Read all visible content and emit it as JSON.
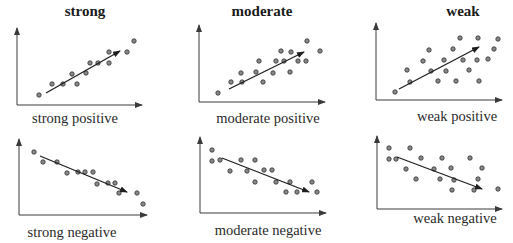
{
  "columns": [
    {
      "title": "strong",
      "x": 85
    },
    {
      "title": "moderate",
      "x": 262
    },
    {
      "title": "weak",
      "x": 463
    }
  ],
  "chart_data": [
    {
      "type": "scatter",
      "title": "strong positive",
      "strength": "strong",
      "direction": "positive",
      "axes": {
        "origin": [
          17,
          105
        ],
        "y_top": 28,
        "x_right": 142
      },
      "label_pos": [
        75,
        110
      ],
      "points": [
        [
          39,
          95
        ],
        [
          52,
          84
        ],
        [
          63,
          84
        ],
        [
          72,
          74
        ],
        [
          77,
          84
        ],
        [
          86,
          73
        ],
        [
          90,
          63
        ],
        [
          98,
          63
        ],
        [
          109,
          52
        ],
        [
          109,
          63
        ],
        [
          127,
          52
        ],
        [
          134,
          41
        ]
      ],
      "trend_arrow": {
        "from": [
          46,
          93
        ],
        "to": [
          120,
          51
        ]
      }
    },
    {
      "type": "scatter",
      "title": "moderate positive",
      "strength": "moderate",
      "direction": "positive",
      "axes": {
        "origin": [
          199,
          102
        ],
        "y_top": 25,
        "x_right": 325
      },
      "label_pos": [
        268,
        110
      ],
      "points": [
        [
          218,
          93
        ],
        [
          231,
          82
        ],
        [
          241,
          73
        ],
        [
          242,
          82
        ],
        [
          256,
          72
        ],
        [
          259,
          61
        ],
        [
          263,
          82
        ],
        [
          273,
          73
        ],
        [
          276,
          61
        ],
        [
          281,
          51
        ],
        [
          284,
          61
        ],
        [
          291,
          52
        ],
        [
          290,
          72
        ],
        [
          298,
          61
        ],
        [
          306,
          61
        ],
        [
          307,
          41
        ],
        [
          320,
          51
        ]
      ],
      "trend_arrow": {
        "from": [
          229,
          89
        ],
        "to": [
          304,
          52
        ]
      }
    },
    {
      "type": "scatter",
      "title": "weak positive",
      "strength": "weak",
      "direction": "positive",
      "axes": {
        "origin": [
          376,
          100
        ],
        "y_top": 23,
        "x_right": 502
      },
      "label_pos": [
        457,
        108
      ],
      "points": [
        [
          395,
          92
        ],
        [
          410,
          82
        ],
        [
          407,
          70
        ],
        [
          423,
          61
        ],
        [
          429,
          50
        ],
        [
          431,
          71
        ],
        [
          438,
          81
        ],
        [
          444,
          60
        ],
        [
          446,
          71
        ],
        [
          453,
          49
        ],
        [
          456,
          81
        ],
        [
          460,
          38
        ],
        [
          463,
          60
        ],
        [
          469,
          70
        ],
        [
          477,
          60
        ],
        [
          478,
          38
        ],
        [
          479,
          81
        ],
        [
          488,
          59
        ],
        [
          494,
          49
        ],
        [
          498,
          39
        ]
      ],
      "trend_arrow": {
        "from": [
          399,
          89
        ],
        "to": [
          479,
          47
        ]
      }
    },
    {
      "type": "scatter",
      "title": "strong negative",
      "strength": "strong",
      "direction": "negative",
      "axes": {
        "origin": [
          19,
          215
        ],
        "y_top": 139,
        "x_right": 147
      },
      "label_pos": [
        72,
        224
      ],
      "points": [
        [
          34,
          152
        ],
        [
          43,
          162
        ],
        [
          57,
          162
        ],
        [
          67,
          173
        ],
        [
          78,
          172
        ],
        [
          85,
          172
        ],
        [
          93,
          172
        ],
        [
          97,
          184
        ],
        [
          108,
          183
        ],
        [
          115,
          183
        ],
        [
          119,
          193
        ],
        [
          137,
          193
        ],
        [
          143,
          204
        ]
      ],
      "trend_arrow": {
        "from": [
          40,
          156
        ],
        "to": [
          127,
          192
        ]
      }
    },
    {
      "type": "scatter",
      "title": "moderate negative",
      "strength": "moderate",
      "direction": "negative",
      "axes": {
        "origin": [
          200,
          213
        ],
        "y_top": 137,
        "x_right": 326
      },
      "label_pos": [
        268,
        222
      ],
      "points": [
        [
          212,
          150
        ],
        [
          212,
          161
        ],
        [
          220,
          160
        ],
        [
          230,
          171
        ],
        [
          241,
          160
        ],
        [
          247,
          171
        ],
        [
          255,
          160
        ],
        [
          255,
          182
        ],
        [
          264,
          170
        ],
        [
          272,
          170
        ],
        [
          276,
          182
        ],
        [
          286,
          192
        ],
        [
          290,
          182
        ],
        [
          297,
          192
        ],
        [
          312,
          182
        ],
        [
          317,
          192
        ]
      ],
      "trend_arrow": {
        "from": [
          222,
          158
        ],
        "to": [
          309,
          192
        ]
      }
    },
    {
      "type": "scatter",
      "title": "weak negative",
      "strength": "weak",
      "direction": "negative",
      "axes": {
        "origin": [
          377,
          209
        ],
        "y_top": 136,
        "x_right": 502
      },
      "label_pos": [
        455,
        210
      ],
      "points": [
        [
          389,
          148
        ],
        [
          389,
          159
        ],
        [
          396,
          159
        ],
        [
          410,
          148
        ],
        [
          406,
          169
        ],
        [
          416,
          179
        ],
        [
          421,
          158
        ],
        [
          434,
          169
        ],
        [
          440,
          179
        ],
        [
          442,
          158
        ],
        [
          451,
          168
        ],
        [
          452,
          190
        ],
        [
          454,
          180
        ],
        [
          470,
          158
        ],
        [
          474,
          190
        ],
        [
          478,
          179
        ],
        [
          482,
          168
        ],
        [
          498,
          189
        ]
      ],
      "trend_arrow": {
        "from": [
          397,
          157
        ],
        "to": [
          482,
          189
        ]
      }
    }
  ],
  "colors": {
    "axis": "#3a3a3a",
    "point_fill": "#8a8a8a",
    "point_stroke": "#2e2e2e",
    "arrow": "#1e1e1e"
  }
}
